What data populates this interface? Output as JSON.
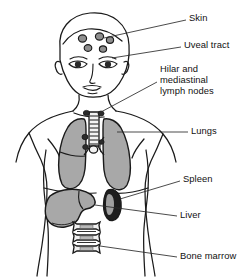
{
  "figure": {
    "ink_color": "#1a1a1a",
    "organ_fill": "#a8a8a8",
    "background": "#ffffff"
  },
  "labels": [
    {
      "id": "skin",
      "text": "Skin",
      "x": 189,
      "y": 17,
      "lines": [
        "Skin"
      ]
    },
    {
      "id": "uveal-tract",
      "text": "Uveal tract",
      "x": 184,
      "y": 44,
      "lines": [
        "Uveal tract"
      ]
    },
    {
      "id": "hilar-mediastinal-lymph-nodes",
      "text": "Hilar and mediastinal lymph nodes",
      "x": 160,
      "y": 68,
      "lines": [
        "Hilar and",
        "mediastinal",
        "lymph nodes"
      ]
    },
    {
      "id": "lungs",
      "text": "Lungs",
      "x": 191,
      "y": 129,
      "lines": [
        "Lungs"
      ]
    },
    {
      "id": "spleen",
      "text": "Spleen",
      "x": 183,
      "y": 177,
      "lines": [
        "Spleen"
      ]
    },
    {
      "id": "liver",
      "text": "Liver",
      "x": 180,
      "y": 213,
      "lines": [
        "Liver"
      ]
    },
    {
      "id": "bone-marrow",
      "text": "Bone marrow",
      "x": 180,
      "y": 253,
      "lines": [
        "Bone marrow"
      ]
    }
  ],
  "organs": [
    {
      "id": "skin-lesions",
      "name": "Skin lesions (forehead nodules)",
      "count": 5
    },
    {
      "id": "uveal-tract",
      "name": "Uveal tract (eyes)",
      "count": 2
    },
    {
      "id": "lymph-nodes",
      "name": "Hilar and mediastinal lymph nodes",
      "count": 1
    },
    {
      "id": "lungs",
      "name": "Lungs",
      "count": 2
    },
    {
      "id": "spleen",
      "name": "Spleen",
      "count": 1
    },
    {
      "id": "liver",
      "name": "Liver",
      "count": 1
    },
    {
      "id": "bone-marrow",
      "name": "Bone marrow (vertebrae)",
      "count": 3
    }
  ]
}
